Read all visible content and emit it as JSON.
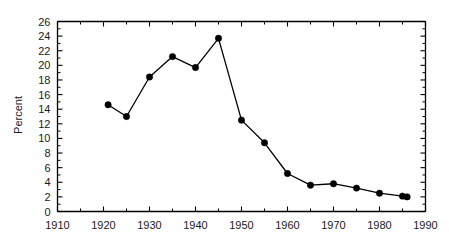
{
  "chart_data": {
    "type": "line",
    "title": "",
    "subtitle": "",
    "xlabel": "",
    "ylabel": "Percent",
    "xlim": [
      1910,
      1990
    ],
    "ylim": [
      0,
      26
    ],
    "xticks": [
      1910,
      1920,
      1930,
      1940,
      1950,
      1960,
      1970,
      1980,
      1990
    ],
    "xtick_labels": [
      "1910",
      "1920",
      "1930",
      "1940",
      "1950",
      "1960",
      "1970",
      "1980",
      "1990"
    ],
    "x_minor_tick_step": 5,
    "yticks": [
      0,
      2,
      4,
      6,
      8,
      10,
      12,
      14,
      16,
      18,
      20,
      22,
      24,
      26
    ],
    "ytick_labels": [
      "0",
      "2",
      "4",
      "6",
      "8",
      "10",
      "12",
      "14",
      "16",
      "18",
      "20",
      "22",
      "24",
      "26"
    ],
    "y_minor_tick_step": 1,
    "grid": false,
    "legend": null,
    "legend_position": "none",
    "marker": "filled-circle",
    "line_color": "#000000",
    "marker_color": "#000000",
    "background_color": "#ffffff",
    "axis_color": "#000000",
    "series": [
      {
        "name": "Percent",
        "x": [
          1921,
          1925,
          1930,
          1935,
          1940,
          1945,
          1950,
          1955,
          1960,
          1965,
          1970,
          1975,
          1980,
          1985,
          1986
        ],
        "values": [
          14.6,
          13.0,
          18.4,
          21.2,
          19.7,
          23.7,
          12.5,
          9.4,
          5.2,
          3.6,
          3.8,
          3.2,
          2.5,
          2.1,
          2.0
        ]
      }
    ]
  },
  "axes": {
    "y_axis_title": "Percent"
  }
}
